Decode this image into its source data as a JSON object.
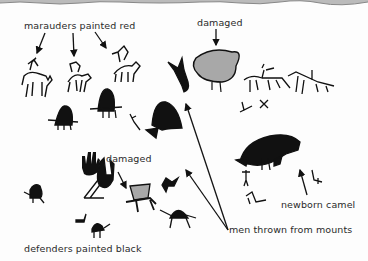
{
  "labels": {
    "marauders": "marauders painted red",
    "damaged_top": "damaged",
    "damaged_mid": "damaged",
    "defenders": "defenders painted black",
    "men_thrown": "men thrown from mounts",
    "newborn": "newborn camel"
  },
  "colors": {
    "ink": "#111111",
    "damaged_fill": "#a8a8a8",
    "background": "#fdfdfd"
  }
}
